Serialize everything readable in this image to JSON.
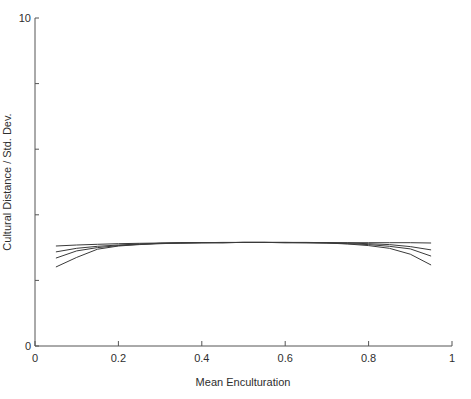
{
  "chart_data": {
    "type": "line",
    "title": "",
    "xlabel": "Mean Enculturation",
    "ylabel": "Cultural Distance / Std. Dev.",
    "xlim": [
      0,
      1
    ],
    "ylim": [
      0,
      10
    ],
    "grid": false,
    "legend": null,
    "x_ticks": [
      0,
      0.2,
      0.4,
      0.6,
      0.8,
      1
    ],
    "x_tick_labels": [
      "0",
      "0.2",
      "0.4",
      "0.6",
      "0.8",
      "1"
    ],
    "y_ticks": [
      0,
      2,
      4,
      6,
      8,
      10
    ],
    "y_tick_labels": [
      "0",
      "",
      "",
      "",
      "",
      "10"
    ],
    "x": [
      0.05,
      0.1,
      0.15,
      0.2,
      0.25,
      0.3,
      0.35,
      0.4,
      0.45,
      0.5,
      0.55,
      0.6,
      0.65,
      0.7,
      0.75,
      0.8,
      0.85,
      0.9,
      0.95
    ],
    "series": [
      {
        "name": "series 1",
        "values": [
          3.05,
          3.08,
          3.1,
          3.12,
          3.13,
          3.14,
          3.15,
          3.15,
          3.16,
          3.16,
          3.16,
          3.16,
          3.16,
          3.15,
          3.15,
          3.15,
          3.15,
          3.15,
          3.14
        ]
      },
      {
        "name": "series 2",
        "values": [
          2.87,
          2.98,
          3.04,
          3.08,
          3.11,
          3.13,
          3.14,
          3.15,
          3.15,
          3.16,
          3.16,
          3.16,
          3.15,
          3.15,
          3.14,
          3.12,
          3.09,
          3.03,
          2.93
        ]
      },
      {
        "name": "series 3",
        "values": [
          2.68,
          2.9,
          3.0,
          3.06,
          3.1,
          3.13,
          3.14,
          3.15,
          3.15,
          3.16,
          3.16,
          3.15,
          3.15,
          3.14,
          3.12,
          3.09,
          3.04,
          2.96,
          2.74
        ]
      },
      {
        "name": "series 4",
        "values": [
          2.41,
          2.7,
          2.95,
          3.05,
          3.09,
          3.12,
          3.14,
          3.15,
          3.15,
          3.16,
          3.16,
          3.15,
          3.15,
          3.14,
          3.11,
          3.06,
          2.98,
          2.8,
          2.47
        ]
      }
    ],
    "line_color": "#3a3a3a"
  }
}
